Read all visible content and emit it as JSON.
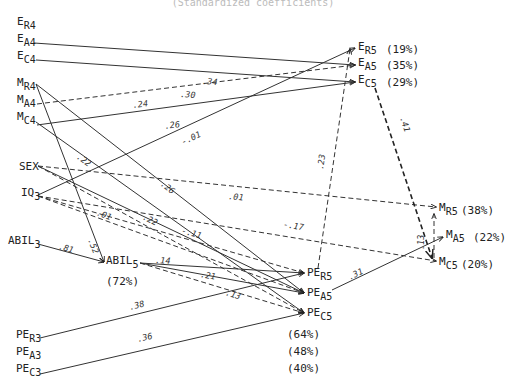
{
  "title": "(Standardized coefficients)",
  "nodes": [
    {
      "id": "ER4",
      "base": "E",
      "sub": "R4",
      "x": 17,
      "y": 25
    },
    {
      "id": "EA4",
      "base": "E",
      "sub": "A4",
      "x": 17,
      "y": 42
    },
    {
      "id": "EC4",
      "base": "E",
      "sub": "C4",
      "x": 17,
      "y": 59
    },
    {
      "id": "MR4",
      "base": "M",
      "sub": "R4",
      "x": 17,
      "y": 86
    },
    {
      "id": "MA4",
      "base": "M",
      "sub": "A4",
      "x": 17,
      "y": 103
    },
    {
      "id": "MC4",
      "base": "M",
      "sub": "C4",
      "x": 17,
      "y": 120
    },
    {
      "id": "SEX",
      "base": "SEX",
      "sub": "",
      "x": 19,
      "y": 170
    },
    {
      "id": "IQ3",
      "base": "IQ",
      "sub": "3",
      "x": 21,
      "y": 196
    },
    {
      "id": "ABIL3",
      "base": "ABIL",
      "sub": "3",
      "x": 8,
      "y": 244
    },
    {
      "id": "ABIL5",
      "base": "ABIL",
      "sub": "5",
      "x": 106,
      "y": 264
    },
    {
      "id": "PER5",
      "base": "PE",
      "sub": "R5",
      "x": 307,
      "y": 276
    },
    {
      "id": "PEA5",
      "base": "PE",
      "sub": "A5",
      "x": 307,
      "y": 296
    },
    {
      "id": "PEC5",
      "base": "PE",
      "sub": "C5",
      "x": 307,
      "y": 316
    },
    {
      "id": "PER3",
      "base": "PE",
      "sub": "R3",
      "x": 16,
      "y": 338
    },
    {
      "id": "PEA3",
      "base": "PE",
      "sub": "A3",
      "x": 16,
      "y": 355
    },
    {
      "id": "PEC3",
      "base": "PE",
      "sub": "C3",
      "x": 16,
      "y": 372
    },
    {
      "id": "ER5",
      "base": "E",
      "sub": "R5",
      "x": 358,
      "y": 50
    },
    {
      "id": "EA5",
      "base": "E",
      "sub": "A5",
      "x": 358,
      "y": 66
    },
    {
      "id": "EC5",
      "base": "E",
      "sub": "C5",
      "x": 358,
      "y": 83
    },
    {
      "id": "MR5",
      "base": "M",
      "sub": "R5",
      "x": 439,
      "y": 211
    },
    {
      "id": "MA5",
      "base": "M",
      "sub": "A5",
      "x": 446,
      "y": 238
    },
    {
      "id": "MC5",
      "base": "M",
      "sub": "C5",
      "x": 439,
      "y": 265
    }
  ],
  "variance_explained": [
    {
      "node": "ER5",
      "label": "(19%)",
      "x": 386,
      "y": 50
    },
    {
      "node": "EA5",
      "label": "(35%)",
      "x": 386,
      "y": 66
    },
    {
      "node": "EC5",
      "label": "(29%)",
      "x": 386,
      "y": 83
    },
    {
      "node": "MR5",
      "label": "(38%)",
      "x": 461,
      "y": 211
    },
    {
      "node": "MA5",
      "label": "(22%)",
      "x": 473,
      "y": 238
    },
    {
      "node": "MC5",
      "label": "(20%)",
      "x": 461,
      "y": 265
    },
    {
      "node": "ABIL5",
      "label": "(72%)",
      "x": 106,
      "y": 282
    },
    {
      "node": "PER5",
      "label": "(64%)",
      "x": 287,
      "y": 335
    },
    {
      "node": "PEA5",
      "label": "(48%)",
      "x": 287,
      "y": 352
    },
    {
      "node": "PEC5",
      "label": "(40%)",
      "x": 287,
      "y": 369
    }
  ],
  "paths": [
    {
      "from": "EA4",
      "to": "EA5",
      "coef": ".34",
      "style": "solid",
      "x1": 34,
      "y1": 43,
      "x2": 355,
      "y2": 65,
      "lx": 202,
      "ly": 84
    },
    {
      "from": "EC4",
      "to": "EC5",
      "coef": ".30",
      "style": "solid",
      "x1": 36,
      "y1": 60,
      "x2": 355,
      "y2": 82,
      "lx": 180,
      "ly": 97
    },
    {
      "from": "MA4",
      "to": "EA5",
      "coef": ".24",
      "style": "dashed",
      "x1": 37,
      "y1": 104,
      "x2": 355,
      "y2": 65,
      "lx": 133,
      "ly": 108
    },
    {
      "from": "MC4",
      "to": "EC5",
      "coef": ".26",
      "style": "solid",
      "x1": 37,
      "y1": 125,
      "x2": 355,
      "y2": 82,
      "lx": 165,
      "ly": 129
    },
    {
      "from": "IQ3",
      "to": "ER5",
      "coef": "-.01",
      "style": "solid",
      "x1": 38,
      "y1": 195,
      "x2": 355,
      "y2": 48,
      "lx": 183,
      "ly": 145
    },
    {
      "from": "MR4",
      "to": "ABIL5",
      "coef": ".52",
      "style": "solid",
      "x1": 36,
      "y1": 84,
      "x2": 104,
      "y2": 262,
      "lx": 88,
      "ly": 240
    },
    {
      "from": "MR4",
      "to": "PEA5",
      "coef": ".26",
      "style": "solid",
      "x1": 36,
      "y1": 84,
      "x2": 304,
      "y2": 293,
      "lx": 160,
      "ly": 185
    },
    {
      "from": "MC4",
      "to": "PEC5",
      "coef": ".22",
      "style": "solid",
      "x1": 36,
      "y1": 122,
      "x2": 304,
      "y2": 313,
      "lx": 76,
      "ly": 158
    },
    {
      "from": "SEX",
      "to": "MR5",
      "coef": ".01",
      "style": "dashed",
      "x1": 38,
      "y1": 166,
      "x2": 436,
      "y2": 207,
      "lx": 228,
      "ly": 199
    },
    {
      "from": "SEX",
      "to": "PEA5",
      "coef": ".22",
      "style": "solid",
      "x1": 38,
      "y1": 166,
      "x2": 304,
      "y2": 293,
      "lx": 142,
      "ly": 219
    },
    {
      "from": "IQ3",
      "to": "MC5",
      "coef": "-.17",
      "style": "dashed",
      "x1": 38,
      "y1": 196,
      "x2": 436,
      "y2": 261,
      "lx": 283,
      "ly": 227
    },
    {
      "from": "IQ3",
      "to": "PER5",
      "coef": "-.11",
      "style": "dashed",
      "x1": 38,
      "y1": 196,
      "x2": 304,
      "y2": 273,
      "lx": 181,
      "ly": 233
    },
    {
      "from": "IQ3",
      "to": "PEA5",
      "coef": ".01",
      "style": "dashed",
      "x1": 38,
      "y1": 196,
      "x2": 304,
      "y2": 293,
      "lx": 96,
      "ly": 215
    },
    {
      "from": "SEX",
      "to": "PEC5",
      "coef": "",
      "style": "dashed",
      "x1": 38,
      "y1": 166,
      "x2": 304,
      "y2": 313,
      "lx": 0,
      "ly": 0
    },
    {
      "from": "ABIL3",
      "to": "ABIL5",
      "coef": ".81",
      "style": "solid",
      "x1": 38,
      "y1": 244,
      "x2": 104,
      "y2": 262,
      "lx": 58,
      "ly": 249
    },
    {
      "from": "ABIL5",
      "to": "PER5",
      "coef": ".14",
      "style": "solid",
      "x1": 140,
      "y1": 263,
      "x2": 304,
      "y2": 273,
      "lx": 155,
      "ly": 263
    },
    {
      "from": "ABIL5",
      "to": "PEA5",
      "coef": ".21",
      "style": "solid",
      "x1": 140,
      "y1": 263,
      "x2": 304,
      "y2": 293,
      "lx": 200,
      "ly": 277
    },
    {
      "from": "ABIL5",
      "to": "PEC5",
      "coef": ".13",
      "style": "dashed",
      "x1": 140,
      "y1": 263,
      "x2": 304,
      "y2": 313,
      "lx": 225,
      "ly": 295
    },
    {
      "from": "PER3",
      "to": "PER5",
      "coef": ".38",
      "style": "solid",
      "x1": 40,
      "y1": 338,
      "x2": 304,
      "y2": 273,
      "lx": 130,
      "ly": 310
    },
    {
      "from": "PEC3",
      "to": "PEC5",
      "coef": ".36",
      "style": "solid",
      "x1": 40,
      "y1": 374,
      "x2": 304,
      "y2": 313,
      "lx": 138,
      "ly": 342
    },
    {
      "from": "PER5",
      "to": "ER5",
      "coef": ".23",
      "style": "dashed",
      "x1": 318,
      "y1": 268,
      "x2": 350,
      "y2": 49,
      "lx": 323,
      "ly": 170
    },
    {
      "from": "PEA5",
      "to": "MA5",
      "coef": ".31",
      "style": "solid",
      "x1": 332,
      "y1": 290,
      "x2": 443,
      "y2": 237,
      "lx": 350,
      "ly": 280
    },
    {
      "from": "EC5",
      "to": "MC5",
      "coef": ".41",
      "style": "thickdash",
      "x1": 375,
      "y1": 88,
      "x2": 432,
      "y2": 258,
      "lx": 400,
      "ly": 118
    },
    {
      "from": "MC5",
      "to": "MR5",
      "coef": ".13",
      "style": "dashed",
      "x1": 434,
      "y1": 258,
      "x2": 434,
      "y2": 214,
      "lx": 424,
      "ly": 250
    }
  ]
}
